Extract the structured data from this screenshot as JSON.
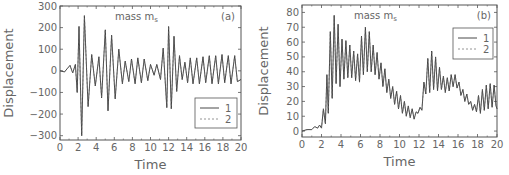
{
  "chart_data": [
    {
      "id": "a",
      "type": "line",
      "panel_label": "(a)",
      "title": "mass m_s",
      "title_main": "mass m",
      "title_sub": "s",
      "xlabel": "Time",
      "ylabel": "Displacement",
      "xlim": [
        0,
        20
      ],
      "ylim": [
        -320,
        300
      ],
      "xticks": [
        0,
        2,
        4,
        6,
        8,
        10,
        12,
        14,
        16,
        18,
        20
      ],
      "yticks": [
        -300,
        -200,
        -100,
        0,
        100,
        200,
        300
      ],
      "grid": false,
      "legend": {
        "position": "lower right",
        "entries": [
          {
            "label": "1",
            "style": "solid"
          },
          {
            "label": "2",
            "style": "dashed"
          }
        ]
      },
      "series": [
        {
          "name": "1",
          "style": "solid",
          "x": [
            0,
            0.5,
            0.8,
            1.1,
            1.4,
            1.7,
            1.9,
            2.1,
            2.4,
            2.7,
            3.1,
            3.5,
            3.9,
            4.3,
            4.6,
            5.0,
            5.3,
            5.7,
            6.1,
            6.5,
            6.9,
            7.2,
            7.6,
            7.9,
            8.3,
            8.6,
            9.0,
            9.3,
            9.7,
            10.0,
            10.4,
            10.7,
            11.1,
            11.4,
            11.8,
            12.0,
            12.3,
            12.6,
            12.9,
            13.2,
            13.5,
            13.8,
            14.1,
            14.4,
            14.7,
            15.1,
            15.4,
            15.8,
            16.1,
            16.5,
            16.8,
            17.2,
            17.5,
            17.9,
            18.2,
            18.6,
            18.9,
            19.3,
            19.6,
            20.0
          ],
          "y": [
            0,
            -5,
            10,
            25,
            -10,
            30,
            -100,
            205,
            -300,
            255,
            -165,
            75,
            -70,
            65,
            -125,
            190,
            -185,
            165,
            -130,
            100,
            -60,
            45,
            -50,
            55,
            -60,
            60,
            -55,
            55,
            -45,
            30,
            -20,
            30,
            -40,
            105,
            -170,
            205,
            -175,
            160,
            -95,
            70,
            -40,
            40,
            -55,
            60,
            -60,
            60,
            -60,
            65,
            -55,
            70,
            -60,
            70,
            -60,
            75,
            -55,
            70,
            -60,
            70,
            -50,
            -40
          ]
        },
        {
          "name": "2",
          "style": "dashed",
          "x": [
            0,
            0.5,
            0.8,
            1.1,
            1.4,
            1.7,
            1.9,
            2.1,
            2.4,
            2.7,
            3.1,
            3.5,
            3.9,
            4.3,
            4.6,
            5.0,
            5.3,
            5.7,
            6.1,
            6.5,
            6.9,
            7.2,
            7.6,
            7.9,
            8.3,
            8.6,
            9.0,
            9.3,
            9.7,
            10.0,
            10.4,
            10.7,
            11.1,
            11.4,
            11.8,
            12.0,
            12.3,
            12.6,
            12.9,
            13.2,
            13.5,
            13.8,
            14.1,
            14.4,
            14.7,
            15.1,
            15.4,
            15.8,
            16.1,
            16.5,
            16.8,
            17.2,
            17.5,
            17.9,
            18.2,
            18.6,
            18.9,
            19.3,
            19.6,
            20.0
          ],
          "y": [
            0,
            -5,
            10,
            25,
            -10,
            30,
            -100,
            205,
            -300,
            255,
            -165,
            75,
            -70,
            65,
            -125,
            190,
            -185,
            165,
            -130,
            100,
            -60,
            45,
            -50,
            55,
            -60,
            60,
            -55,
            55,
            -45,
            30,
            -20,
            30,
            -40,
            105,
            -170,
            205,
            -175,
            160,
            -95,
            70,
            -40,
            40,
            -55,
            60,
            -60,
            60,
            -60,
            65,
            -55,
            70,
            -60,
            70,
            -60,
            75,
            -55,
            70,
            -60,
            70,
            -50,
            -40
          ]
        }
      ]
    },
    {
      "id": "b",
      "type": "line",
      "panel_label": "(b)",
      "title": "mass m_s",
      "title_main": "mass m",
      "title_sub": "s",
      "xlabel": "Time",
      "ylabel": "Displacement",
      "xlim": [
        0,
        20
      ],
      "ylim": [
        -4,
        85
      ],
      "xticks": [
        0,
        2,
        4,
        6,
        8,
        10,
        12,
        14,
        16,
        18,
        20
      ],
      "yticks": [
        0,
        10,
        20,
        30,
        40,
        50,
        60,
        70,
        80
      ],
      "grid": false,
      "legend": {
        "position": "upper right",
        "entries": [
          {
            "label": "1",
            "style": "solid"
          },
          {
            "label": "2",
            "style": "dashed"
          }
        ]
      },
      "series": [
        {
          "name": "1",
          "style": "solid",
          "x": [
            0,
            0.5,
            1.0,
            1.3,
            1.6,
            1.8,
            2.0,
            2.2,
            2.4,
            2.55,
            2.7,
            2.9,
            3.1,
            3.3,
            3.5,
            3.7,
            3.9,
            4.1,
            4.3,
            4.5,
            4.7,
            4.9,
            5.1,
            5.3,
            5.5,
            5.7,
            5.9,
            6.1,
            6.3,
            6.5,
            6.7,
            6.9,
            7.1,
            7.3,
            7.5,
            7.7,
            7.9,
            8.1,
            8.3,
            8.5,
            8.7,
            8.9,
            9.1,
            9.3,
            9.5,
            9.7,
            9.9,
            10.1,
            10.3,
            10.5,
            10.7,
            10.9,
            11.1,
            11.3,
            11.5,
            11.7,
            11.9,
            12.1,
            12.3,
            12.5,
            12.7,
            12.9,
            13.1,
            13.3,
            13.5,
            13.7,
            13.9,
            14.1,
            14.3,
            14.5,
            14.7,
            14.9,
            15.1,
            15.3,
            15.5,
            15.7,
            15.9,
            16.1,
            16.3,
            16.5,
            16.7,
            16.9,
            17.1,
            17.3,
            17.5,
            17.7,
            17.9,
            18.1,
            18.3,
            18.5,
            18.7,
            18.9,
            19.1,
            19.3,
            19.5,
            19.7,
            19.9,
            20.0
          ],
          "y": [
            0,
            1,
            1,
            3,
            2,
            4,
            2,
            15,
            5,
            38,
            12,
            67,
            22,
            78,
            32,
            72,
            30,
            62,
            35,
            61,
            36,
            58,
            36,
            54,
            34,
            52,
            33,
            64,
            38,
            70,
            40,
            67,
            40,
            58,
            38,
            53,
            35,
            46,
            30,
            42,
            26,
            35,
            22,
            30,
            18,
            27,
            15,
            24,
            12,
            20,
            10,
            17,
            9,
            15,
            8,
            13,
            12,
            16,
            14,
            33,
            25,
            49,
            26,
            54,
            28,
            50,
            27,
            43,
            28,
            37,
            26,
            36,
            27,
            38,
            30,
            38,
            29,
            33,
            24,
            28,
            20,
            25,
            18,
            20,
            14,
            18,
            13,
            24,
            12,
            28,
            14,
            31,
            15,
            32,
            16,
            31,
            17,
            15
          ]
        },
        {
          "name": "2",
          "style": "dashed",
          "x": [
            0,
            0.5,
            1.0,
            1.3,
            1.6,
            1.8,
            2.0,
            2.2,
            2.4,
            2.55,
            2.7,
            2.9,
            3.1,
            3.3,
            3.5,
            3.7,
            3.9,
            4.1,
            4.3,
            4.5,
            4.7,
            4.9,
            5.1,
            5.3,
            5.5,
            5.7,
            5.9,
            6.1,
            6.3,
            6.5,
            6.7,
            6.9,
            7.1,
            7.3,
            7.5,
            7.7,
            7.9,
            8.1,
            8.3,
            8.5,
            8.7,
            8.9,
            9.1,
            9.3,
            9.5,
            9.7,
            9.9,
            10.1,
            10.3,
            10.5,
            10.7,
            10.9,
            11.1,
            11.3,
            11.5,
            11.7,
            11.9,
            12.1,
            12.3,
            12.5,
            12.7,
            12.9,
            13.1,
            13.3,
            13.5,
            13.7,
            13.9,
            14.1,
            14.3,
            14.5,
            14.7,
            14.9,
            15.1,
            15.3,
            15.5,
            15.7,
            15.9,
            16.1,
            16.3,
            16.5,
            16.7,
            16.9,
            17.1,
            17.3,
            17.5,
            17.7,
            17.9,
            18.1,
            18.3,
            18.5,
            18.7,
            18.9,
            19.1,
            19.3,
            19.5,
            19.7,
            19.9,
            20.0
          ],
          "y": [
            0,
            1,
            1,
            3,
            2,
            4,
            2,
            15,
            5,
            38,
            12,
            67,
            22,
            78,
            32,
            72,
            30,
            62,
            35,
            61,
            36,
            58,
            36,
            54,
            34,
            52,
            33,
            64,
            38,
            70,
            40,
            67,
            40,
            58,
            38,
            53,
            35,
            46,
            30,
            42,
            26,
            35,
            22,
            30,
            18,
            27,
            15,
            24,
            12,
            20,
            10,
            17,
            9,
            15,
            8,
            13,
            12,
            16,
            14,
            33,
            25,
            49,
            26,
            54,
            28,
            50,
            27,
            43,
            28,
            37,
            26,
            36,
            27,
            38,
            30,
            38,
            29,
            33,
            24,
            28,
            20,
            25,
            18,
            20,
            14,
            18,
            13,
            24,
            12,
            28,
            14,
            31,
            15,
            32,
            16,
            31,
            17,
            15
          ]
        }
      ]
    }
  ],
  "layout": {
    "panels": [
      {
        "left": 0,
        "plot": {
          "x0": 60,
          "y0": 6,
          "x1": 241,
          "y1": 140
        },
        "legend_box": {
          "x": 195,
          "y": 98,
          "w": 42,
          "h": 30
        }
      },
      {
        "left": 0,
        "plot": {
          "x0": 302,
          "y0": 5,
          "x1": 497,
          "y1": 137
        },
        "legend_box": {
          "x": 453,
          "y": 28,
          "w": 40,
          "h": 31
        }
      }
    ],
    "line_color": "#333333",
    "axis_color": "#555555",
    "text_color": "#666666"
  }
}
